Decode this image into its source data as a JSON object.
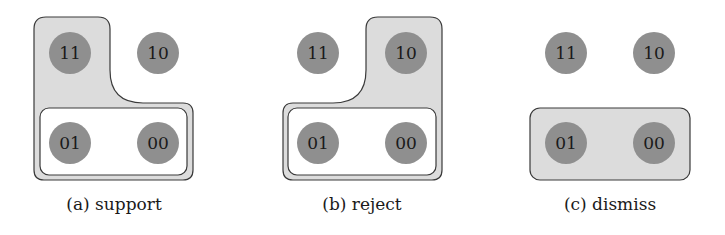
{
  "colors": {
    "region_fill": "#dcdcdc",
    "region_stroke": "#3a3a3a",
    "node_fill": "#8f8f8f",
    "inner_fill": "#ffffff",
    "text": "#1a1a1a"
  },
  "panels": [
    {
      "id": "a",
      "caption": "(a) support",
      "nodes": [
        {
          "label": "11"
        },
        {
          "label": "10"
        },
        {
          "label": "01"
        },
        {
          "label": "00"
        }
      ],
      "highlighted_region": [
        "11",
        "01",
        "00"
      ],
      "inner_region": [
        "01",
        "00"
      ]
    },
    {
      "id": "b",
      "caption": "(b) reject",
      "nodes": [
        {
          "label": "11"
        },
        {
          "label": "10"
        },
        {
          "label": "01"
        },
        {
          "label": "00"
        }
      ],
      "highlighted_region": [
        "10",
        "01",
        "00"
      ],
      "inner_region": [
        "01",
        "00"
      ]
    },
    {
      "id": "c",
      "caption": "(c) dismiss",
      "nodes": [
        {
          "label": "11"
        },
        {
          "label": "10"
        },
        {
          "label": "01"
        },
        {
          "label": "00"
        }
      ],
      "highlighted_region": [
        "01",
        "00"
      ]
    }
  ]
}
